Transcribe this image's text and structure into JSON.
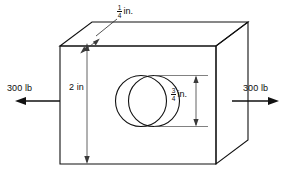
{
  "figure": {
    "background_color": "#ffffff",
    "line_color": "#111111",
    "dimension_line_color": "#3a3a3a"
  },
  "forces": {
    "left": {
      "label": "300 lb",
      "magnitude": 300,
      "unit": "lb",
      "direction": "left",
      "arrow_icon": "arrow-left-icon"
    },
    "right": {
      "label": "300 lb",
      "magnitude": 300,
      "unit": "lb",
      "direction": "right",
      "arrow_icon": "arrow-right-icon"
    }
  },
  "dimensions": {
    "thickness": {
      "numerator": "1",
      "denominator": "4",
      "unit": "in.",
      "value": 0.25,
      "full_label": "1/4 in.",
      "leader_icon": "leader-arrow-icon"
    },
    "height": {
      "label": "2 in",
      "value": 2,
      "unit": "in",
      "arrow_icon": "double-arrow-vertical-icon"
    },
    "hole_diameter": {
      "numerator": "3",
      "denominator": "4",
      "unit": "in.",
      "value": 0.75,
      "full_label": "3/4 in.",
      "arrow_icon": "double-arrow-vertical-icon"
    }
  },
  "geometry": {
    "shape": "rectangular-plate",
    "feature": "through-circular-hole",
    "hole_count": 1
  }
}
